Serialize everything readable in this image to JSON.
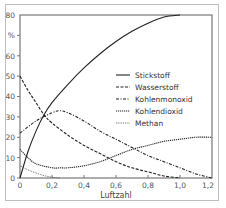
{
  "chart_data": {
    "type": "line",
    "title": "",
    "xlabel": "Luftzahl",
    "ylabel": "%",
    "xlim": [
      0,
      1.2
    ],
    "ylim": [
      0,
      80
    ],
    "grid": false,
    "legend_position": "right-center",
    "x_ticks": [
      "0",
      "0,2",
      "0,4",
      "0,6",
      "0,8",
      "1,0",
      "1,2"
    ],
    "y_ticks": [
      "0",
      "10",
      "20",
      "30",
      "40",
      "50",
      "60",
      "%",
      "80"
    ],
    "series": [
      {
        "name": "Stickstoff",
        "style": "solid",
        "x": [
          0,
          0.05,
          0.1,
          0.15,
          0.2,
          0.3,
          0.4,
          0.5,
          0.6,
          0.7,
          0.8,
          0.9,
          1.0
        ],
        "y": [
          0,
          13,
          23,
          31,
          37,
          46,
          54,
          61,
          67,
          72,
          76,
          79,
          80
        ]
      },
      {
        "name": "Wasserstoff",
        "style": "dashed",
        "x": [
          0,
          0.05,
          0.1,
          0.15,
          0.2,
          0.3,
          0.4,
          0.5,
          0.6,
          0.7,
          0.8,
          0.9,
          1.0
        ],
        "y": [
          50,
          43,
          37,
          31,
          27,
          21,
          16,
          12,
          8,
          5,
          3,
          1,
          0
        ]
      },
      {
        "name": "Kohlenmonoxid",
        "style": "dash-dot",
        "x": [
          0,
          0.1,
          0.2,
          0.25,
          0.3,
          0.4,
          0.5,
          0.6,
          0.7,
          0.8,
          0.9,
          1.0,
          1.1,
          1.2
        ],
        "y": [
          22,
          28,
          32,
          33,
          32,
          28,
          23,
          19,
          15,
          11,
          8,
          5,
          2,
          0
        ]
      },
      {
        "name": "Kohlendioxid",
        "style": "dotted-dense",
        "x": [
          0,
          0.05,
          0.1,
          0.2,
          0.25,
          0.3,
          0.4,
          0.5,
          0.6,
          0.7,
          0.8,
          0.9,
          1.0,
          1.1,
          1.2
        ],
        "y": [
          14,
          10,
          7,
          5,
          5,
          5,
          6,
          8,
          11,
          14,
          16,
          18,
          19,
          20,
          20
        ]
      },
      {
        "name": "Methan",
        "style": "dotted",
        "x": [
          0,
          0.05,
          0.1,
          0.15,
          0.2,
          0.25
        ],
        "y": [
          6,
          4,
          2.5,
          1.2,
          0.4,
          0
        ]
      }
    ]
  },
  "labels": {
    "xlabel": "Luftzahl",
    "x_ticks": [
      "0",
      "0,2",
      "0,4",
      "0,6",
      "0,8",
      "1,0",
      "1,2"
    ],
    "y_ticks": [
      "0",
      "10",
      "20",
      "30",
      "40",
      "50",
      "60",
      "%",
      "80"
    ],
    "legend": [
      "Stickstoff",
      "Wasserstoff",
      "Kohlenmonoxid",
      "Kohlendioxid",
      "Methan"
    ]
  }
}
